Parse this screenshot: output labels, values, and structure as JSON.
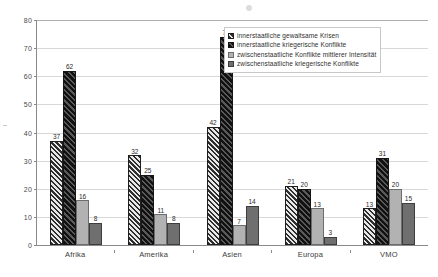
{
  "chart_data": {
    "type": "bar",
    "title": "",
    "xlabel": "",
    "ylabel": "",
    "ylim": [
      0,
      80
    ],
    "ytick_step": 10,
    "yticks": [
      "0",
      "10",
      "20",
      "30",
      "40",
      "50",
      "60",
      "70",
      "80"
    ],
    "grid": true,
    "legend_position": "top-right",
    "categories": [
      "Afrika",
      "Amerika",
      "Asien",
      "Europa",
      "VMO"
    ],
    "series": [
      {
        "name": "innerstaatliche gewaltsame  Krisen",
        "fill": "light-hatch",
        "color": "#cfcfcf",
        "values": [
          37,
          32,
          42,
          21,
          13
        ]
      },
      {
        "name": "innerstaatliche kriegerische Konflikte",
        "fill": "dark-hatch",
        "color": "#3a3a3a",
        "values": [
          62,
          25,
          74,
          20,
          31
        ]
      },
      {
        "name": "zwischenstaatliche Konflikte mittlerer Intensität",
        "fill": "solid-light-gray",
        "color": "#b2b2b2",
        "values": [
          16,
          11,
          7,
          13,
          20
        ]
      },
      {
        "name": "zwischenstaatliche kriegerische Konflikte",
        "fill": "solid-dark-gray",
        "color": "#6f6f6f",
        "values": [
          8,
          8,
          14,
          3,
          15
        ]
      }
    ]
  }
}
